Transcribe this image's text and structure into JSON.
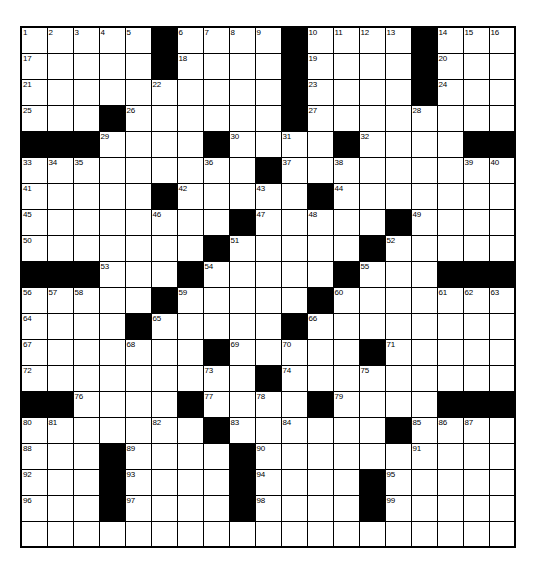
{
  "puzzle": {
    "kind": "crossword-grid",
    "rows": 20,
    "cols": 19,
    "colors": {
      "block": "#000000",
      "cell": "#ffffff",
      "grid_line": "#000000",
      "number_text": "#000000"
    },
    "grid": [
      [
        {
          "t": "open",
          "n": "1"
        },
        {
          "t": "open",
          "n": "2"
        },
        {
          "t": "open",
          "n": "3"
        },
        {
          "t": "open",
          "n": "4"
        },
        {
          "t": "open",
          "n": "5"
        },
        {
          "t": "block"
        },
        {
          "t": "open",
          "n": "6"
        },
        {
          "t": "open",
          "n": "7"
        },
        {
          "t": "open",
          "n": "8"
        },
        {
          "t": "open",
          "n": "9"
        },
        {
          "t": "block"
        },
        {
          "t": "open",
          "n": "10"
        },
        {
          "t": "open",
          "n": "11"
        },
        {
          "t": "open",
          "n": "12"
        },
        {
          "t": "open",
          "n": "13"
        },
        {
          "t": "block"
        },
        {
          "t": "open",
          "n": "14"
        },
        {
          "t": "open",
          "n": "15"
        },
        {
          "t": "open",
          "n": "16"
        }
      ],
      [
        {
          "t": "open",
          "n": "17"
        },
        {
          "t": "open"
        },
        {
          "t": "open"
        },
        {
          "t": "open"
        },
        {
          "t": "open"
        },
        {
          "t": "block"
        },
        {
          "t": "open",
          "n": "18"
        },
        {
          "t": "open"
        },
        {
          "t": "open"
        },
        {
          "t": "open"
        },
        {
          "t": "block"
        },
        {
          "t": "open",
          "n": "19"
        },
        {
          "t": "open"
        },
        {
          "t": "open"
        },
        {
          "t": "open"
        },
        {
          "t": "block"
        },
        {
          "t": "open",
          "n": "20"
        },
        {
          "t": "open"
        },
        {
          "t": "open"
        }
      ],
      [
        {
          "t": "open",
          "n": "21"
        },
        {
          "t": "open"
        },
        {
          "t": "open"
        },
        {
          "t": "open"
        },
        {
          "t": "open"
        },
        {
          "t": "open",
          "n": "22"
        },
        {
          "t": "open"
        },
        {
          "t": "open"
        },
        {
          "t": "open"
        },
        {
          "t": "open"
        },
        {
          "t": "block"
        },
        {
          "t": "open",
          "n": "23"
        },
        {
          "t": "open"
        },
        {
          "t": "open"
        },
        {
          "t": "open"
        },
        {
          "t": "block"
        },
        {
          "t": "open",
          "n": "24"
        },
        {
          "t": "open"
        },
        {
          "t": "open"
        }
      ],
      [
        {
          "t": "open",
          "n": "25"
        },
        {
          "t": "open"
        },
        {
          "t": "open"
        },
        {
          "t": "block"
        },
        {
          "t": "open",
          "n": "26"
        },
        {
          "t": "open"
        },
        {
          "t": "open"
        },
        {
          "t": "open"
        },
        {
          "t": "open"
        },
        {
          "t": "open"
        },
        {
          "t": "block"
        },
        {
          "t": "open",
          "n": "27"
        },
        {
          "t": "open"
        },
        {
          "t": "open"
        },
        {
          "t": "open"
        },
        {
          "t": "open",
          "n": "28"
        },
        {
          "t": "open"
        },
        {
          "t": "open"
        },
        {
          "t": "open"
        }
      ],
      [
        {
          "t": "block"
        },
        {
          "t": "block"
        },
        {
          "t": "block"
        },
        {
          "t": "open",
          "n": "29"
        },
        {
          "t": "open"
        },
        {
          "t": "open"
        },
        {
          "t": "open"
        },
        {
          "t": "block"
        },
        {
          "t": "open",
          "n": "30"
        },
        {
          "t": "open"
        },
        {
          "t": "open",
          "n": "31"
        },
        {
          "t": "open"
        },
        {
          "t": "block"
        },
        {
          "t": "open",
          "n": "32"
        },
        {
          "t": "open"
        },
        {
          "t": "open"
        },
        {
          "t": "open"
        },
        {
          "t": "block"
        },
        {
          "t": "block"
        }
      ],
      [
        {
          "t": "open",
          "n": "33"
        },
        {
          "t": "open",
          "n": "34"
        },
        {
          "t": "open",
          "n": "35"
        },
        {
          "t": "open"
        },
        {
          "t": "open"
        },
        {
          "t": "open"
        },
        {
          "t": "open"
        },
        {
          "t": "open",
          "n": "36"
        },
        {
          "t": "open"
        },
        {
          "t": "block"
        },
        {
          "t": "open",
          "n": "37"
        },
        {
          "t": "open"
        },
        {
          "t": "open",
          "n": "38"
        },
        {
          "t": "open"
        },
        {
          "t": "open"
        },
        {
          "t": "open"
        },
        {
          "t": "open"
        },
        {
          "t": "open",
          "n": "39"
        },
        {
          "t": "open",
          "n": "40"
        }
      ],
      [
        {
          "t": "open",
          "n": "41"
        },
        {
          "t": "open"
        },
        {
          "t": "open"
        },
        {
          "t": "open"
        },
        {
          "t": "open"
        },
        {
          "t": "block"
        },
        {
          "t": "open",
          "n": "42"
        },
        {
          "t": "open"
        },
        {
          "t": "open"
        },
        {
          "t": "open",
          "n": "43"
        },
        {
          "t": "open"
        },
        {
          "t": "block"
        },
        {
          "t": "open",
          "n": "44"
        },
        {
          "t": "open"
        },
        {
          "t": "open"
        },
        {
          "t": "open"
        },
        {
          "t": "open"
        },
        {
          "t": "open"
        },
        {
          "t": "open"
        }
      ],
      [
        {
          "t": "open",
          "n": "45"
        },
        {
          "t": "open"
        },
        {
          "t": "open"
        },
        {
          "t": "open"
        },
        {
          "t": "open"
        },
        {
          "t": "open",
          "n": "46"
        },
        {
          "t": "open"
        },
        {
          "t": "open"
        },
        {
          "t": "block"
        },
        {
          "t": "open",
          "n": "47"
        },
        {
          "t": "open"
        },
        {
          "t": "open",
          "n": "48"
        },
        {
          "t": "open"
        },
        {
          "t": "open"
        },
        {
          "t": "block"
        },
        {
          "t": "open",
          "n": "49"
        },
        {
          "t": "open"
        },
        {
          "t": "open"
        },
        {
          "t": "open"
        }
      ],
      [
        {
          "t": "open",
          "n": "50"
        },
        {
          "t": "open"
        },
        {
          "t": "open"
        },
        {
          "t": "open"
        },
        {
          "t": "open"
        },
        {
          "t": "open"
        },
        {
          "t": "open"
        },
        {
          "t": "block"
        },
        {
          "t": "open",
          "n": "51"
        },
        {
          "t": "open"
        },
        {
          "t": "open"
        },
        {
          "t": "open"
        },
        {
          "t": "open"
        },
        {
          "t": "block"
        },
        {
          "t": "open",
          "n": "52"
        },
        {
          "t": "open"
        },
        {
          "t": "open"
        },
        {
          "t": "open"
        },
        {
          "t": "open"
        }
      ],
      [
        {
          "t": "block"
        },
        {
          "t": "block"
        },
        {
          "t": "block"
        },
        {
          "t": "open",
          "n": "53"
        },
        {
          "t": "open"
        },
        {
          "t": "open"
        },
        {
          "t": "block"
        },
        {
          "t": "open",
          "n": "54"
        },
        {
          "t": "open"
        },
        {
          "t": "open"
        },
        {
          "t": "open"
        },
        {
          "t": "open"
        },
        {
          "t": "block"
        },
        {
          "t": "open",
          "n": "55"
        },
        {
          "t": "open"
        },
        {
          "t": "open"
        },
        {
          "t": "block"
        },
        {
          "t": "block"
        },
        {
          "t": "block"
        }
      ],
      [
        {
          "t": "open",
          "n": "56"
        },
        {
          "t": "open",
          "n": "57"
        },
        {
          "t": "open",
          "n": "58"
        },
        {
          "t": "open"
        },
        {
          "t": "open"
        },
        {
          "t": "block"
        },
        {
          "t": "open",
          "n": "59"
        },
        {
          "t": "open"
        },
        {
          "t": "open"
        },
        {
          "t": "open"
        },
        {
          "t": "open"
        },
        {
          "t": "block"
        },
        {
          "t": "open",
          "n": "60"
        },
        {
          "t": "open"
        },
        {
          "t": "open"
        },
        {
          "t": "open"
        },
        {
          "t": "open",
          "n": "61"
        },
        {
          "t": "open",
          "n": "62"
        },
        {
          "t": "open",
          "n": "63"
        }
      ],
      [
        {
          "t": "open",
          "n": "64"
        },
        {
          "t": "open"
        },
        {
          "t": "open"
        },
        {
          "t": "open"
        },
        {
          "t": "block"
        },
        {
          "t": "open",
          "n": "65"
        },
        {
          "t": "open"
        },
        {
          "t": "open"
        },
        {
          "t": "open"
        },
        {
          "t": "open"
        },
        {
          "t": "block"
        },
        {
          "t": "open",
          "n": "66"
        },
        {
          "t": "open"
        },
        {
          "t": "open"
        },
        {
          "t": "open"
        },
        {
          "t": "open"
        },
        {
          "t": "open"
        },
        {
          "t": "open"
        },
        {
          "t": "open"
        }
      ],
      [
        {
          "t": "open",
          "n": "67"
        },
        {
          "t": "open"
        },
        {
          "t": "open"
        },
        {
          "t": "open"
        },
        {
          "t": "open",
          "n": "68"
        },
        {
          "t": "open"
        },
        {
          "t": "open"
        },
        {
          "t": "block"
        },
        {
          "t": "open",
          "n": "69"
        },
        {
          "t": "open"
        },
        {
          "t": "open",
          "n": "70"
        },
        {
          "t": "open"
        },
        {
          "t": "open"
        },
        {
          "t": "block"
        },
        {
          "t": "open",
          "n": "71"
        },
        {
          "t": "open"
        },
        {
          "t": "open"
        },
        {
          "t": "open"
        },
        {
          "t": "open"
        }
      ],
      [
        {
          "t": "open",
          "n": "72"
        },
        {
          "t": "open"
        },
        {
          "t": "open"
        },
        {
          "t": "open"
        },
        {
          "t": "open"
        },
        {
          "t": "open"
        },
        {
          "t": "open"
        },
        {
          "t": "open",
          "n": "73"
        },
        {
          "t": "open"
        },
        {
          "t": "block"
        },
        {
          "t": "open",
          "n": "74"
        },
        {
          "t": "open"
        },
        {
          "t": "open"
        },
        {
          "t": "open",
          "n": "75"
        },
        {
          "t": "open"
        },
        {
          "t": "open"
        },
        {
          "t": "open"
        },
        {
          "t": "open"
        },
        {
          "t": "open"
        }
      ],
      [
        {
          "t": "block"
        },
        {
          "t": "block"
        },
        {
          "t": "open",
          "n": "76"
        },
        {
          "t": "open"
        },
        {
          "t": "open"
        },
        {
          "t": "open"
        },
        {
          "t": "block"
        },
        {
          "t": "open",
          "n": "77"
        },
        {
          "t": "open"
        },
        {
          "t": "open",
          "n": "78"
        },
        {
          "t": "open"
        },
        {
          "t": "block"
        },
        {
          "t": "open",
          "n": "79"
        },
        {
          "t": "open"
        },
        {
          "t": "open"
        },
        {
          "t": "open"
        },
        {
          "t": "block"
        },
        {
          "t": "block"
        },
        {
          "t": "block"
        }
      ],
      [
        {
          "t": "open",
          "n": "80"
        },
        {
          "t": "open",
          "n": "81"
        },
        {
          "t": "open"
        },
        {
          "t": "open"
        },
        {
          "t": "open"
        },
        {
          "t": "open",
          "n": "82"
        },
        {
          "t": "open"
        },
        {
          "t": "block"
        },
        {
          "t": "open",
          "n": "83"
        },
        {
          "t": "open"
        },
        {
          "t": "open",
          "n": "84"
        },
        {
          "t": "open"
        },
        {
          "t": "open"
        },
        {
          "t": "open"
        },
        {
          "t": "block"
        },
        {
          "t": "open",
          "n": "85"
        },
        {
          "t": "open",
          "n": "86"
        },
        {
          "t": "open",
          "n": "87"
        },
        {
          "t": "open"
        }
      ],
      [
        {
          "t": "open",
          "n": "88"
        },
        {
          "t": "open"
        },
        {
          "t": "open"
        },
        {
          "t": "block"
        },
        {
          "t": "open",
          "n": "89"
        },
        {
          "t": "open"
        },
        {
          "t": "open"
        },
        {
          "t": "open"
        },
        {
          "t": "block"
        },
        {
          "t": "open",
          "n": "90"
        },
        {
          "t": "open"
        },
        {
          "t": "open"
        },
        {
          "t": "open"
        },
        {
          "t": "open"
        },
        {
          "t": "open"
        },
        {
          "t": "open",
          "n": "91"
        },
        {
          "t": "open"
        },
        {
          "t": "open"
        },
        {
          "t": "open"
        }
      ],
      [
        {
          "t": "open",
          "n": "92"
        },
        {
          "t": "open"
        },
        {
          "t": "open"
        },
        {
          "t": "block"
        },
        {
          "t": "open",
          "n": "93"
        },
        {
          "t": "open"
        },
        {
          "t": "open"
        },
        {
          "t": "open"
        },
        {
          "t": "block"
        },
        {
          "t": "open",
          "n": "94"
        },
        {
          "t": "open"
        },
        {
          "t": "open"
        },
        {
          "t": "open"
        },
        {
          "t": "block"
        },
        {
          "t": "open",
          "n": "95"
        },
        {
          "t": "open"
        },
        {
          "t": "open"
        },
        {
          "t": "open"
        },
        {
          "t": "open"
        }
      ],
      [
        {
          "t": "open",
          "n": "96"
        },
        {
          "t": "open"
        },
        {
          "t": "open"
        },
        {
          "t": "block"
        },
        {
          "t": "open",
          "n": "97"
        },
        {
          "t": "open"
        },
        {
          "t": "open"
        },
        {
          "t": "open"
        },
        {
          "t": "block"
        },
        {
          "t": "open",
          "n": "98"
        },
        {
          "t": "open"
        },
        {
          "t": "open"
        },
        {
          "t": "open"
        },
        {
          "t": "block"
        },
        {
          "t": "open",
          "n": "99"
        },
        {
          "t": "open"
        },
        {
          "t": "open"
        },
        {
          "t": "open"
        },
        {
          "t": "open"
        }
      ],
      [
        {
          "t": "open"
        },
        {
          "t": "open"
        },
        {
          "t": "open"
        },
        {
          "t": "open"
        },
        {
          "t": "open"
        },
        {
          "t": "open"
        },
        {
          "t": "open"
        },
        {
          "t": "open"
        },
        {
          "t": "open"
        },
        {
          "t": "open"
        },
        {
          "t": "open"
        },
        {
          "t": "open"
        },
        {
          "t": "open"
        },
        {
          "t": "open"
        },
        {
          "t": "open"
        },
        {
          "t": "open"
        },
        {
          "t": "open"
        },
        {
          "t": "open"
        },
        {
          "t": "open"
        }
      ]
    ]
  }
}
